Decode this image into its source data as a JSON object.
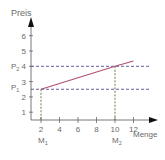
{
  "chart_data": {
    "type": "line",
    "title": "",
    "xlabel": "Menge",
    "ylabel": "Preis",
    "xlim": [
      0,
      13
    ],
    "ylim": [
      0,
      6.5
    ],
    "x_ticks": [
      2,
      4,
      6,
      8,
      10,
      12
    ],
    "y_ticks": [
      1,
      2,
      3,
      4,
      5,
      6
    ],
    "grid": false,
    "series": [
      {
        "name": "Preis-Menge-Linie",
        "color": "#b0506a",
        "points": [
          [
            2,
            2.5
          ],
          [
            10,
            4
          ],
          [
            12,
            4.35
          ]
        ]
      }
    ],
    "reference_points": [
      {
        "x_label": "M1",
        "x_sub": "1",
        "x_base": "M",
        "x": 2,
        "y_label": "P1",
        "y_sub": "1",
        "y_base": "P",
        "y": 2.5
      },
      {
        "x_label": "M2",
        "x_sub": "2",
        "x_base": "M",
        "x": 10,
        "y_label": "P2",
        "y_sub": "2",
        "y_base": "P",
        "y": 4
      }
    ],
    "colors": {
      "axis": "#555555",
      "text": "#6a6a6a",
      "horizontal_guides": "#3a3a8a",
      "vertical_guides": "#4a5a20",
      "sub_labels": "#8a8a30"
    }
  }
}
